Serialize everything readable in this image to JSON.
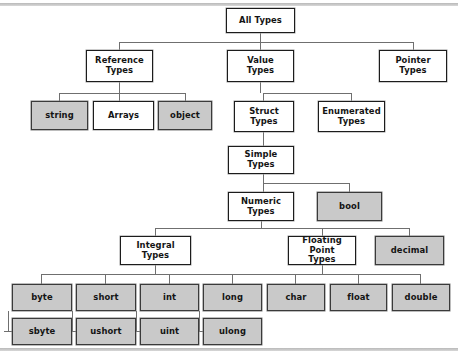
{
  "diagram": {
    "type": "tree-hierarchy",
    "palette": {
      "shaded_fill": "#c9c9c9",
      "plain_fill": "#ffffff",
      "border": "#1c1c1c",
      "connector": "#6f6f6f",
      "text": "#141414"
    },
    "nodes": [
      {
        "id": "all-types",
        "label": "All Types",
        "shaded": false,
        "x": 226,
        "y": 8,
        "w": 69,
        "h": 25
      },
      {
        "id": "reference-types",
        "label": "Reference\nTypes",
        "shaded": false,
        "x": 86,
        "y": 50,
        "w": 67,
        "h": 32
      },
      {
        "id": "value-types",
        "label": "Value\nTypes",
        "shaded": false,
        "x": 227,
        "y": 50,
        "w": 67,
        "h": 32
      },
      {
        "id": "pointer-types",
        "label": "Pointer\nTypes",
        "shaded": false,
        "x": 379,
        "y": 50,
        "w": 68,
        "h": 32
      },
      {
        "id": "string",
        "label": "string",
        "shaded": true,
        "x": 31,
        "y": 101,
        "w": 57,
        "h": 29
      },
      {
        "id": "arrays",
        "label": "Arrays",
        "shaded": false,
        "x": 93,
        "y": 101,
        "w": 61,
        "h": 29
      },
      {
        "id": "object",
        "label": "object",
        "shaded": true,
        "x": 158,
        "y": 101,
        "w": 54,
        "h": 29
      },
      {
        "id": "struct-types",
        "label": "Struct\nTypes",
        "shaded": false,
        "x": 234,
        "y": 101,
        "w": 60,
        "h": 31
      },
      {
        "id": "enumerated-types",
        "label": "Enumerated\nTypes",
        "shaded": false,
        "x": 318,
        "y": 101,
        "w": 67,
        "h": 31
      },
      {
        "id": "simple-types",
        "label": "Simple\nTypes",
        "shaded": false,
        "x": 228,
        "y": 146,
        "w": 66,
        "h": 28
      },
      {
        "id": "numeric-types",
        "label": "Numeric\nTypes",
        "shaded": false,
        "x": 228,
        "y": 192,
        "w": 66,
        "h": 29
      },
      {
        "id": "bool",
        "label": "bool",
        "shaded": true,
        "x": 317,
        "y": 192,
        "w": 65,
        "h": 29
      },
      {
        "id": "integral-types",
        "label": "Integral\nTypes",
        "shaded": false,
        "x": 120,
        "y": 236,
        "w": 71,
        "h": 29
      },
      {
        "id": "floating-point",
        "label": "Floating Point\nTypes",
        "shaded": false,
        "x": 288,
        "y": 236,
        "w": 68,
        "h": 29
      },
      {
        "id": "decimal",
        "label": "decimal",
        "shaded": true,
        "x": 375,
        "y": 236,
        "w": 69,
        "h": 29
      },
      {
        "id": "byte",
        "label": "byte",
        "shaded": true,
        "x": 12,
        "y": 284,
        "w": 60,
        "h": 27
      },
      {
        "id": "short",
        "label": "short",
        "shaded": true,
        "x": 76,
        "y": 284,
        "w": 60,
        "h": 27
      },
      {
        "id": "int",
        "label": "int",
        "shaded": true,
        "x": 140,
        "y": 284,
        "w": 59,
        "h": 27
      },
      {
        "id": "long",
        "label": "long",
        "shaded": true,
        "x": 203,
        "y": 284,
        "w": 59,
        "h": 27
      },
      {
        "id": "char",
        "label": "char",
        "shaded": true,
        "x": 267,
        "y": 284,
        "w": 58,
        "h": 27
      },
      {
        "id": "float",
        "label": "float",
        "shaded": true,
        "x": 330,
        "y": 284,
        "w": 57,
        "h": 27
      },
      {
        "id": "double",
        "label": "double",
        "shaded": true,
        "x": 392,
        "y": 284,
        "w": 58,
        "h": 27
      },
      {
        "id": "sbyte",
        "label": "sbyte",
        "shaded": true,
        "x": 12,
        "y": 318,
        "w": 60,
        "h": 27
      },
      {
        "id": "ushort",
        "label": "ushort",
        "shaded": true,
        "x": 76,
        "y": 318,
        "w": 60,
        "h": 27
      },
      {
        "id": "uint",
        "label": "uint",
        "shaded": true,
        "x": 140,
        "y": 318,
        "w": 59,
        "h": 27
      },
      {
        "id": "ulong",
        "label": "ulong",
        "shaded": true,
        "x": 203,
        "y": 318,
        "w": 59,
        "h": 27
      }
    ],
    "connectors": [
      {
        "cls": "v",
        "x": 260,
        "y": 33,
        "w": 1,
        "h": 9
      },
      {
        "cls": "h",
        "x": 119,
        "y": 42,
        "w": 294,
        "h": 1
      },
      {
        "cls": "v",
        "x": 119,
        "y": 42,
        "w": 1,
        "h": 8
      },
      {
        "cls": "v",
        "x": 260,
        "y": 42,
        "w": 1,
        "h": 8
      },
      {
        "cls": "v",
        "x": 413,
        "y": 42,
        "w": 1,
        "h": 8
      },
      {
        "cls": "v",
        "x": 119,
        "y": 82,
        "w": 1,
        "h": 11
      },
      {
        "cls": "h",
        "x": 59,
        "y": 93,
        "w": 127,
        "h": 1
      },
      {
        "cls": "v",
        "x": 59,
        "y": 93,
        "w": 1,
        "h": 8
      },
      {
        "cls": "v",
        "x": 119,
        "y": 93,
        "w": 1,
        "h": 8
      },
      {
        "cls": "v",
        "x": 185,
        "y": 93,
        "w": 1,
        "h": 8
      },
      {
        "cls": "v",
        "x": 260,
        "y": 82,
        "w": 1,
        "h": 11
      },
      {
        "cls": "h",
        "x": 263,
        "y": 93,
        "w": 89,
        "h": 1
      },
      {
        "cls": "v",
        "x": 263,
        "y": 93,
        "w": 1,
        "h": 8
      },
      {
        "cls": "v",
        "x": 351,
        "y": 93,
        "w": 1,
        "h": 8
      },
      {
        "cls": "v",
        "x": 263,
        "y": 132,
        "w": 1,
        "h": 14
      },
      {
        "cls": "v",
        "x": 263,
        "y": 174,
        "w": 1,
        "h": 9
      },
      {
        "cls": "h",
        "x": 263,
        "y": 183,
        "w": 87,
        "h": 1
      },
      {
        "cls": "v",
        "x": 263,
        "y": 183,
        "w": 1,
        "h": 9
      },
      {
        "cls": "v",
        "x": 349,
        "y": 183,
        "w": 1,
        "h": 9
      },
      {
        "cls": "v",
        "x": 261,
        "y": 221,
        "w": 1,
        "h": 7
      },
      {
        "cls": "h",
        "x": 155,
        "y": 228,
        "w": 255,
        "h": 1
      },
      {
        "cls": "v",
        "x": 155,
        "y": 228,
        "w": 1,
        "h": 8
      },
      {
        "cls": "v",
        "x": 322,
        "y": 228,
        "w": 1,
        "h": 8
      },
      {
        "cls": "v",
        "x": 409,
        "y": 228,
        "w": 1,
        "h": 8
      },
      {
        "cls": "v",
        "x": 155,
        "y": 265,
        "w": 1,
        "h": 9
      },
      {
        "cls": "h",
        "x": 41,
        "y": 274,
        "w": 255,
        "h": 1
      },
      {
        "cls": "v",
        "x": 41,
        "y": 274,
        "w": 1,
        "h": 10
      },
      {
        "cls": "v",
        "x": 105,
        "y": 274,
        "w": 1,
        "h": 10
      },
      {
        "cls": "v",
        "x": 169,
        "y": 274,
        "w": 1,
        "h": 10
      },
      {
        "cls": "v",
        "x": 232,
        "y": 274,
        "w": 1,
        "h": 10
      },
      {
        "cls": "v",
        "x": 322,
        "y": 265,
        "w": 1,
        "h": 9
      },
      {
        "cls": "h",
        "x": 295,
        "y": 274,
        "w": 126,
        "h": 1
      },
      {
        "cls": "v",
        "x": 295,
        "y": 274,
        "w": 1,
        "h": 10
      },
      {
        "cls": "v",
        "x": 358,
        "y": 274,
        "w": 1,
        "h": 10
      },
      {
        "cls": "v",
        "x": 420,
        "y": 274,
        "w": 1,
        "h": 10
      },
      {
        "cls": "v",
        "x": 72,
        "y": 311,
        "w": 1,
        "h": 20
      },
      {
        "cls": "h",
        "x": 66,
        "y": 331,
        "w": 11,
        "h": 1
      },
      {
        "cls": "v",
        "x": 136,
        "y": 311,
        "w": 1,
        "h": 20
      },
      {
        "cls": "h",
        "x": 130,
        "y": 331,
        "w": 11,
        "h": 1
      },
      {
        "cls": "v",
        "x": 199,
        "y": 311,
        "w": 1,
        "h": 20
      },
      {
        "cls": "h",
        "x": 194,
        "y": 331,
        "w": 11,
        "h": 1
      },
      {
        "cls": "v",
        "x": 8,
        "y": 311,
        "w": 1,
        "h": 20
      },
      {
        "cls": "h",
        "x": 4,
        "y": 331,
        "w": 10,
        "h": 1
      }
    ]
  }
}
